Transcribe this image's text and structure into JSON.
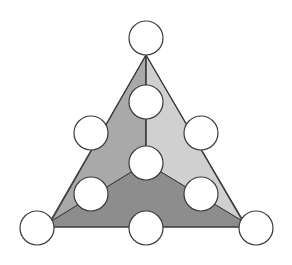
{
  "diagram": {
    "type": "triangle-number-puzzle",
    "colors": {
      "left_region": "#a9a9a9",
      "right_region": "#d0d0d0",
      "bottom_region": "#8d8d8d",
      "outline": "#3a3a3a",
      "circle_fill": "#ffffff"
    },
    "circles": [
      {
        "id": "top",
        "cx": 146,
        "cy": 38
      },
      {
        "id": "upper-middle",
        "cx": 146,
        "cy": 102
      },
      {
        "id": "left-upper",
        "cx": 91,
        "cy": 133
      },
      {
        "id": "right-upper",
        "cx": 201,
        "cy": 133
      },
      {
        "id": "center",
        "cx": 146,
        "cy": 163
      },
      {
        "id": "left-lower",
        "cx": 91,
        "cy": 194
      },
      {
        "id": "right-lower",
        "cx": 201,
        "cy": 194
      },
      {
        "id": "bottom-left",
        "cx": 37,
        "cy": 228
      },
      {
        "id": "bottom-middle",
        "cx": 146,
        "cy": 228
      },
      {
        "id": "bottom-right",
        "cx": 256,
        "cy": 228
      }
    ],
    "circle_radius": 17
  }
}
